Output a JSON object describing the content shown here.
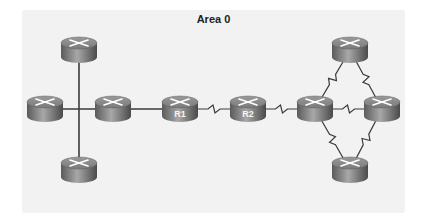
{
  "diagram": {
    "title": "Area 0",
    "colors": {
      "background": "#f2f2f2",
      "link": "#3a3a3a",
      "router_top": "#8a8a8a",
      "router_side": "#6e6e6e",
      "router_arrows": "#ffffff"
    },
    "routers": [
      {
        "id": "top-left",
        "label": "",
        "cx": 79,
        "cy": 50
      },
      {
        "id": "left",
        "label": "",
        "cx": 45,
        "cy": 109
      },
      {
        "id": "mid-left",
        "label": "",
        "cx": 113,
        "cy": 109
      },
      {
        "id": "bottom-left",
        "label": "",
        "cx": 79,
        "cy": 170
      },
      {
        "id": "r1",
        "label": "R1",
        "cx": 180,
        "cy": 109
      },
      {
        "id": "r2",
        "label": "R2",
        "cx": 248,
        "cy": 109
      },
      {
        "id": "hub",
        "label": "",
        "cx": 315,
        "cy": 109
      },
      {
        "id": "right",
        "label": "",
        "cx": 382,
        "cy": 109
      },
      {
        "id": "top-right",
        "label": "",
        "cx": 350,
        "cy": 50
      },
      {
        "id": "bottom-right",
        "label": "",
        "cx": 350,
        "cy": 170
      }
    ],
    "links": [
      {
        "from": "top-left",
        "to": "bottom-left",
        "type": "ethernet"
      },
      {
        "from": "left",
        "to": "mid-left",
        "type": "ethernet"
      },
      {
        "from": "mid-left",
        "to": "r1",
        "type": "ethernet"
      },
      {
        "from": "r1",
        "to": "r2",
        "type": "serial"
      },
      {
        "from": "r2",
        "to": "hub",
        "type": "serial"
      },
      {
        "from": "hub",
        "to": "right",
        "type": "serial"
      },
      {
        "from": "hub",
        "to": "top-right",
        "type": "serial"
      },
      {
        "from": "top-right",
        "to": "right",
        "type": "serial"
      },
      {
        "from": "hub",
        "to": "bottom-right",
        "type": "serial"
      },
      {
        "from": "bottom-right",
        "to": "right",
        "type": "serial"
      }
    ]
  }
}
